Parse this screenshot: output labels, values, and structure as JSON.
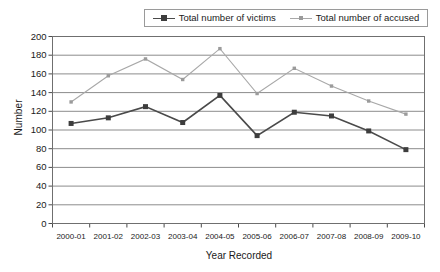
{
  "chart_data": {
    "type": "line",
    "title": "",
    "xlabel": "Year Recorded",
    "ylabel": "Number",
    "categories": [
      "2000-01",
      "2001-02",
      "2002-03",
      "2003-04",
      "2004-05",
      "2005-06",
      "2006-07",
      "2007-08",
      "2008-09",
      "2009-10"
    ],
    "series": [
      {
        "name": "Total number of victims",
        "values": [
          107,
          113,
          125,
          108,
          137,
          94,
          119,
          115,
          99,
          79
        ],
        "color": "#4a4a4a",
        "marker": "square"
      },
      {
        "name": "Total number of accused",
        "values": [
          130,
          158,
          176,
          154,
          187,
          139,
          166,
          147,
          131,
          117
        ],
        "color": "#a8a8a8",
        "marker": "square-small"
      }
    ],
    "ylim": [
      0,
      200
    ],
    "ytick_labels": [
      "200",
      "180",
      "160",
      "140",
      "120",
      "100",
      "80",
      "60",
      "40",
      "20",
      "0"
    ],
    "ytick_values": [
      200,
      180,
      160,
      140,
      120,
      100,
      80,
      60,
      40,
      20,
      0
    ],
    "grid": "horizontal",
    "legend_position": "top-center"
  },
  "legend": {
    "entries": [
      {
        "label": "Total number of victims"
      },
      {
        "label": "Total number of accused"
      }
    ]
  },
  "axes": {
    "y_title": "Number",
    "x_title": "Year Recorded"
  }
}
